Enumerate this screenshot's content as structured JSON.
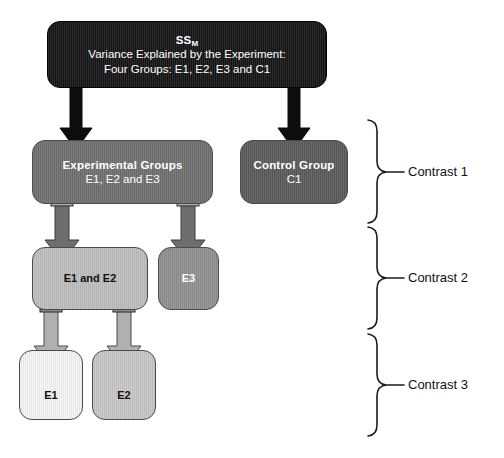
{
  "diagram": {
    "nodes": {
      "ssm": {
        "line1_main": "SS",
        "line1_sub": "M",
        "line2": "Variance Explained by the Experiment:",
        "line3": "Four Groups: E1, E2, E3 and C1",
        "fill": "#141414",
        "text_color": "#ffffff"
      },
      "experimental_groups": {
        "line1": "Experimental Groups",
        "line2": "E1, E2 and E3",
        "fill": "#6e6e6e",
        "text_color": "#ffffff"
      },
      "control_group": {
        "line1": "Control Group",
        "line2": "C1",
        "fill": "#595959",
        "text_color": "#ffffff"
      },
      "e1_and_e2": {
        "line1": "E1 and E2",
        "fill": "#bdbdbd",
        "text_color": "#111111"
      },
      "e3": {
        "line1": "E3",
        "fill": "#8f8f8f",
        "text_color": "#ffffff"
      },
      "e1": {
        "line1": "E1",
        "fill": "#f4f4f4",
        "text_color": "#111111"
      },
      "e2": {
        "line1": "E2",
        "fill": "#c6c6c6",
        "text_color": "#111111"
      }
    },
    "contrasts": [
      {
        "label": "Contrast 1"
      },
      {
        "label": "Contrast 2"
      },
      {
        "label": "Contrast 3"
      }
    ],
    "connectors": [
      {
        "from": "ssm",
        "to": "experimental_groups",
        "color": "#0d0d0d"
      },
      {
        "from": "ssm",
        "to": "control_group",
        "color": "#0d0d0d"
      },
      {
        "from": "experimental_groups",
        "to": "e1_and_e2",
        "color": "#6e6e6e"
      },
      {
        "from": "experimental_groups",
        "to": "e3",
        "color": "#6e6e6e"
      },
      {
        "from": "e1_and_e2",
        "to": "e1",
        "color": "#b0b0b0"
      },
      {
        "from": "e1_and_e2",
        "to": "e2",
        "color": "#b0b0b0"
      }
    ]
  }
}
